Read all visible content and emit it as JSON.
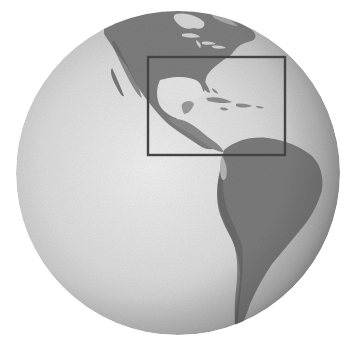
{
  "figure": {
    "type": "orthographic-globe",
    "color_mode": "grayscale",
    "background": "#ffffff",
    "globe": {
      "center_x": 178,
      "center_y": 173,
      "radius": 162,
      "ocean_light": "#e9e9e9",
      "ocean_mid": "#cfcfcf",
      "ocean_dark": "#9a9a9a",
      "land_color": "#7d7d7d",
      "land_dark": "#666666",
      "land_light": "#a3a3a3",
      "lake_color": "#dcdcdc"
    },
    "regions_visible": [
      "North America",
      "Hudson Bay",
      "Great Lakes",
      "Gulf of Mexico",
      "Caribbean Sea",
      "Central America",
      "Cuba",
      "Hispaniola",
      "South America",
      "Pacific Ocean",
      "Atlantic Ocean"
    ],
    "highlight_box": {
      "label": "Gulf of Mexico and Caribbean region",
      "x": 148,
      "y": 57,
      "width": 137,
      "height": 98,
      "stroke": "#444444",
      "stroke_width": 2.4
    }
  }
}
